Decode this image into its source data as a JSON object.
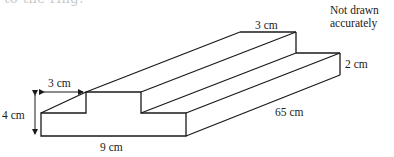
{
  "header": {
    "cut_text": "to the ring."
  },
  "note": {
    "line1": "Not drawn",
    "line2": "accurately"
  },
  "labels": {
    "step_width_front": "3 cm",
    "step_width_back": "3 cm",
    "height_total": "4 cm",
    "step_height": "2 cm",
    "base_width": "9 cm",
    "length": "65 cm"
  },
  "style": {
    "stroke": "#1a1a1a",
    "text": "#222222"
  }
}
